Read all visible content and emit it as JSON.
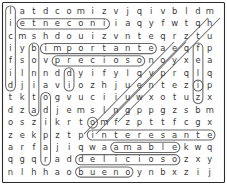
{
  "puzzle": {
    "kind": "word-search",
    "rows": 14,
    "cols": 18,
    "grid": [
      [
        "l",
        "a",
        "t",
        "d",
        "c",
        "o",
        "m",
        "i",
        "z",
        "v",
        "j",
        "q",
        "i",
        "v",
        "b",
        "l",
        "d",
        "m"
      ],
      [
        "i",
        "e",
        "t",
        "n",
        "e",
        "c",
        "o",
        "n",
        "i",
        "i",
        "a",
        "q",
        "y",
        "f",
        "w",
        "t",
        "q",
        "h"
      ],
      [
        "c",
        "m",
        "s",
        "h",
        "d",
        "o",
        "u",
        "i",
        "z",
        "v",
        "n",
        "t",
        "e",
        "q",
        "r",
        "z",
        "t",
        "u"
      ],
      [
        "i",
        "y",
        "b",
        "i",
        "m",
        "p",
        "o",
        "r",
        "t",
        "a",
        "n",
        "t",
        "e",
        "a",
        "e",
        "q",
        "f",
        "p"
      ],
      [
        "f",
        "s",
        "o",
        "v",
        "p",
        "r",
        "e",
        "c",
        "i",
        "o",
        "s",
        "o",
        "n",
        "o",
        "y",
        "x",
        "e",
        "a"
      ],
      [
        "i",
        "l",
        "n",
        "n",
        "d",
        "d",
        "y",
        "i",
        "f",
        "y",
        "l",
        "q",
        "v",
        "p",
        "r",
        "q",
        "l",
        "q"
      ],
      [
        "d",
        "j",
        "i",
        "a",
        "v",
        "i",
        "o",
        "z",
        "h",
        "j",
        "u",
        "e",
        "n",
        "t",
        "e",
        "z",
        "i",
        "p"
      ],
      [
        "t",
        "k",
        "t",
        "o",
        "g",
        "v",
        "u",
        "c",
        "i",
        "i",
        "u",
        "w",
        "x",
        "o",
        "t",
        "u",
        "z",
        "x"
      ],
      [
        "d",
        "z",
        "a",
        "d",
        "j",
        "e",
        "m",
        "s",
        "l",
        "n",
        "g",
        "p",
        "p",
        "g",
        "z",
        "s",
        "b",
        "m"
      ],
      [
        "o",
        "s",
        "z",
        "i",
        "k",
        "r",
        "t",
        "o",
        "m",
        "f",
        "z",
        "p",
        "t",
        "t",
        "f",
        "c",
        "g",
        "x"
      ],
      [
        "z",
        "e",
        "k",
        "p",
        "z",
        "t",
        "p",
        "i",
        "n",
        "t",
        "e",
        "r",
        "e",
        "s",
        "a",
        "n",
        "t",
        "e"
      ],
      [
        "a",
        "r",
        "f",
        "a",
        "j",
        "i",
        "q",
        "w",
        "a",
        "a",
        "m",
        "a",
        "b",
        "l",
        "e",
        "k",
        "w",
        "q"
      ],
      [
        "q",
        "g",
        "q",
        "r",
        "a",
        "d",
        "d",
        "e",
        "l",
        "i",
        "c",
        "i",
        "o",
        "s",
        "o",
        "z",
        "x",
        "y"
      ],
      [
        "n",
        "l",
        "h",
        "h",
        "a",
        "o",
        "b",
        "u",
        "e",
        "n",
        "o",
        "y",
        "n",
        "b",
        "x",
        "z",
        "i",
        "j"
      ]
    ],
    "found_words": [
      {
        "name": "inocente-reversed",
        "text": "etneconi",
        "orientation": "horizontal",
        "row": 1,
        "col_start": 1,
        "col_end": 8
      },
      {
        "name": "importante",
        "text": "importante",
        "orientation": "horizontal",
        "row": 3,
        "col_start": 3,
        "col_end": 12
      },
      {
        "name": "precioso",
        "text": "precioso",
        "orientation": "horizontal",
        "row": 4,
        "col_start": 4,
        "col_end": 11
      },
      {
        "name": "interesante",
        "text": "interesante",
        "orientation": "horizontal",
        "row": 10,
        "col_start": 7,
        "col_end": 17
      },
      {
        "name": "amable",
        "text": "amable",
        "orientation": "horizontal",
        "row": 11,
        "col_start": 9,
        "col_end": 14
      },
      {
        "name": "delicioso",
        "text": "delicioso",
        "orientation": "horizontal",
        "row": 12,
        "col_start": 6,
        "col_end": 14
      },
      {
        "name": "bueno",
        "text": "bueno",
        "orientation": "horizontal",
        "row": 13,
        "col_start": 6,
        "col_end": 10
      },
      {
        "name": "vertical-col0",
        "text": "licifid",
        "orientation": "vertical",
        "col": 0,
        "row_start": 0,
        "row_end": 6
      },
      {
        "name": "vertical-col2",
        "text": "bonita",
        "orientation": "vertical",
        "col": 2,
        "row_start": 3,
        "row_end": 8
      },
      {
        "name": "vertical-col3",
        "text": "odipar",
        "orientation": "vertical",
        "col": 3,
        "row_start": 7,
        "row_end": 12
      },
      {
        "name": "vertical-col5",
        "text": "di",
        "orientation": "vertical",
        "col": 5,
        "row_start": 5,
        "row_end": 6
      },
      {
        "name": "vertical-col16",
        "text": "fela",
        "orientation": "vertical",
        "col": 16,
        "row_start": 3,
        "row_end": 6
      },
      {
        "name": "vertical-col16b",
        "text": "zz",
        "orientation": "vertical",
        "col": 16,
        "row_start": 6,
        "row_end": 7
      },
      {
        "name": "circle-r9c7",
        "text": "o",
        "orientation": "single",
        "row": 9,
        "col": 7
      }
    ],
    "diagonals": [
      {
        "name": "diagonal-line-1",
        "x1": 220,
        "y1": 18,
        "x2": 118,
        "y2": 122
      },
      {
        "name": "diagonal-line-2",
        "x1": 208,
        "y1": 18,
        "x2": 106,
        "y2": 122
      },
      {
        "name": "diagonal-line-3",
        "x1": 186,
        "y1": 42,
        "x2": 96,
        "y2": 134
      },
      {
        "name": "diagonal-line-4",
        "x1": 174,
        "y1": 42,
        "x2": 84,
        "y2": 134
      }
    ],
    "colors": {
      "letter": "#3a3a3a",
      "mark": "#6a6a6a",
      "frame": "#2b2b2b",
      "background": "#ffffff"
    }
  }
}
